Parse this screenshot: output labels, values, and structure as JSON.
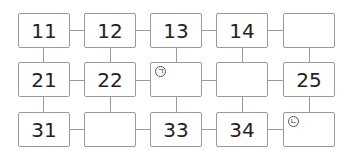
{
  "diagram": {
    "type": "number-grid",
    "rows": [
      [
        {
          "label": "11"
        },
        {
          "label": "12"
        },
        {
          "label": "13"
        },
        {
          "label": "14"
        },
        {
          "label": ""
        }
      ],
      [
        {
          "label": "21"
        },
        {
          "label": "22"
        },
        {
          "label": "",
          "marker": "ㄱ"
        },
        {
          "label": ""
        },
        {
          "label": "25"
        }
      ],
      [
        {
          "label": "31"
        },
        {
          "label": ""
        },
        {
          "label": "33"
        },
        {
          "label": "34"
        },
        {
          "label": "",
          "marker": "ㄴ"
        }
      ]
    ]
  }
}
